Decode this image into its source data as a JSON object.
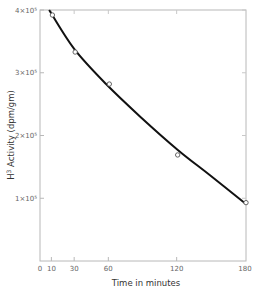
{
  "chart_data": {
    "type": "line",
    "title": "",
    "xlabel": "Time in minutes",
    "ylabel": "H³ Activity (dpm/gm)",
    "xlim": [
      0,
      180
    ],
    "ylim": [
      0,
      400000
    ],
    "grid": false,
    "legend": null,
    "x_ticks": [
      0,
      10,
      30,
      60,
      120,
      180
    ],
    "x_tick_labels": [
      "0",
      "10",
      "30",
      "60",
      "120",
      "180"
    ],
    "y_ticks": [
      100000,
      200000,
      300000,
      400000
    ],
    "y_tick_labels": [
      "1×10⁵",
      "2×10⁵",
      "3×10⁵",
      "4×10⁵"
    ],
    "series": [
      {
        "name": "measured",
        "style": "open-circle markers",
        "x": [
          10,
          30,
          60,
          120,
          180
        ],
        "y": [
          392000,
          333000,
          282000,
          169000,
          93000
        ]
      },
      {
        "name": "fitted curve",
        "style": "solid black line",
        "x": [
          8,
          30,
          58,
          88,
          121,
          149,
          180
        ],
        "y": [
          400000,
          338000,
          282000,
          230000,
          177000,
          137000,
          92000
        ]
      }
    ]
  },
  "axes": {
    "xlabel": "Time in minutes",
    "ylabel_main": "Activity",
    "ylabel_prefix": "H",
    "ylabel_sup": "3",
    "ylabel_units": "(dpm/gm)"
  }
}
